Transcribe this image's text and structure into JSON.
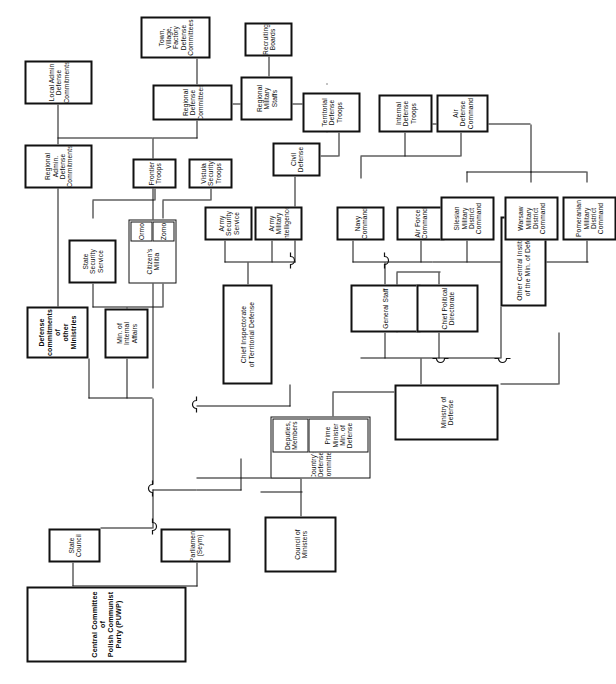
{
  "diagram": {
    "type": "organization-chart",
    "orientation": "rotated-90-ccw",
    "colors": {
      "line": "#111111",
      "box_fill": "#ffffff",
      "text": "#0b0b0b"
    },
    "nodes": {
      "central_committee": "Central Committee of\nPolish Communist Party (PUWP)",
      "state_council": "State\nCouncil",
      "parliament": "Parliament\n(Seym)",
      "council_of_ministers": "Council of Ministers",
      "countrys_defense_committee": "Country's Defense Committee",
      "prime_minister": "Prime Minister\nMin. of Defense",
      "deputies_members": "Deputies,\nMembers",
      "ministry_of_defense": "Ministry of Defense",
      "general_staff": "General Staff",
      "chief_political_directorate": "Chief Political\nDirectorate",
      "chief_inspectorate": "Chief Inspectorate\nof Territorial Defense",
      "other_central_institutions": "Other Central Institutions\nof the Min. of Defense",
      "min_internal_affairs": "Min. of Internal\nAffairs",
      "defense_commitments_other_ministries": "Defense\ncommitments\nof\nother Ministries",
      "state_security_service": "State\nSecurity\nService",
      "citizens_militia": "Citizen's\nMilitia",
      "zomo": "Zomo",
      "ormo": "Ormo",
      "frontier_troops": "Frontier\nTroops",
      "vistula_security_troops": "Vistula\nSecurity\nTroops",
      "regional_admin_defense_commitments": "Regional Admin.\nDefense Commitments",
      "local_admin_defense_commitments": "Local Admin\nDefense Commitments",
      "regional_defense_committees": "Regional\nDefense\nCommittees",
      "town_village_factory_defense_committees": "Town, Village,\nFactory Defense\nCommittees",
      "regional_military_staffs": "Regional\nMilitary\nStaffs",
      "recruiting_boards": "Recruiting\nBoards",
      "territorial_defense_troops": "Territorial\nDefense Troops",
      "internal_defense_troops": "Internal\nDefense Troops",
      "air_defense_command": "Air Defense\nCommand",
      "army_security_service": "Army Security\nService",
      "army_military_intelligence": "Army Military\nIntelligence",
      "civil_defense": "Civil\nDefense",
      "navy_command": "Navy\nCommand",
      "air_force_command": "Air Force\nCommand",
      "silesian_mdc": "Silesian\nMilitary District\nCommand",
      "warsaw_mdc": "Warsaw\nMilitary District\nCommand",
      "pomeranian_mdc": "Pomeranian\nMilitary District\nCommand"
    }
  }
}
